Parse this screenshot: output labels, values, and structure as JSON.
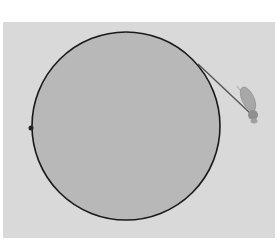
{
  "diagram": {
    "background_color": "#d9d9d9",
    "circle": {
      "cx": 126,
      "cy": 126,
      "r": 94,
      "fill": "#b8b8b8",
      "stroke": "#1a1a1a"
    },
    "point": {
      "cx": 31,
      "cy": 128,
      "r": 2.5,
      "color": "#222222"
    },
    "tangent_line": {
      "x1": 198,
      "y1": 64,
      "x2": 250,
      "y2": 113,
      "color": "#555555"
    },
    "insect": {
      "label": "fly-icon",
      "cx": 250,
      "cy": 102,
      "color": "#9a9a9a"
    }
  }
}
